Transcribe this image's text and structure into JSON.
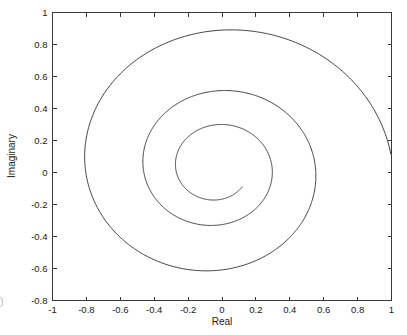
{
  "figure": {
    "background_color": "#ffffff",
    "line_color": "#2b2b2b",
    "axis_color": "#3a3a3a",
    "edge_artifact": ")"
  },
  "chart_data": {
    "type": "line",
    "title": "",
    "subtitle": "",
    "xlabel": "Real",
    "ylabel": "Imaginary",
    "xlim": [
      -1,
      1
    ],
    "ylim": [
      -0.8,
      1
    ],
    "grid": false,
    "legend": null,
    "legend_position": "none",
    "xticks": [
      -1,
      -0.8,
      -0.6,
      -0.4,
      -0.2,
      0,
      0.2,
      0.4,
      0.6,
      0.8,
      1
    ],
    "xticklabels": [
      "-1",
      "-0.8",
      "-0.6",
      "-0.4",
      "-0.2",
      "0",
      "0.2",
      "0.4",
      "0.6",
      "0.8",
      "1"
    ],
    "yticks": [
      -0.8,
      -0.6,
      -0.4,
      -0.2,
      0,
      0.2,
      0.4,
      0.6,
      0.8,
      1
    ],
    "yticklabels": [
      "-0.8",
      "-0.6",
      "-0.4",
      "-0.2",
      "0",
      "0.2",
      "0.4",
      "0.6",
      "0.8",
      "1"
    ],
    "series": [
      {
        "name": "spiral",
        "description": "inward decaying spiral in the complex plane",
        "center": [
          -0.03,
          0.03
        ],
        "theta_start_deg": 5,
        "theta_end_deg": 1040,
        "radius_start": 1.03,
        "decay_per_turn": 0.56,
        "annotations": [
          {
            "label": "outer-loop-top",
            "x": 0.05,
            "y": 0.9
          },
          {
            "label": "outer-loop-left",
            "x": -0.81,
            "y": 0.02
          },
          {
            "label": "outer-loop-bottom",
            "x": -0.06,
            "y": -0.73
          },
          {
            "label": "outer-loop-right-edge",
            "x": 1.0,
            "y": 0.03
          },
          {
            "label": "second-loop-top",
            "x": 0.02,
            "y": 0.58
          },
          {
            "label": "second-loop-left",
            "x": -0.53,
            "y": 0.02
          },
          {
            "label": "second-loop-bottom",
            "x": -0.05,
            "y": -0.48
          },
          {
            "label": "second-loop-right",
            "x": 0.65,
            "y": 0.02
          },
          {
            "label": "third-loop-top",
            "x": 0.0,
            "y": 0.375
          },
          {
            "label": "third-loop-right",
            "x": 0.42,
            "y": 0.02
          },
          {
            "label": "spiral-endpoint",
            "x": -0.21,
            "y": 0.31
          }
        ]
      }
    ]
  }
}
